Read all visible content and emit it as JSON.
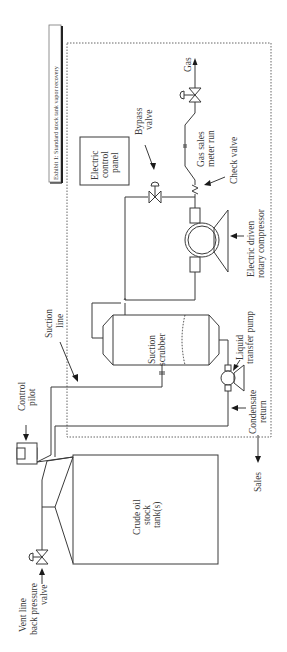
{
  "title": "Exhibit 1: Standard stock tank vapor recovery",
  "labels": {
    "gas": "Gas",
    "gas_sales_meter_run": [
      "Gas sales",
      "meter run"
    ],
    "check_valve": "Check valve",
    "bypass_valve": [
      "Bypass",
      "valve"
    ],
    "electric_control_panel": [
      "Electric",
      "control",
      "panel"
    ],
    "compressor": [
      "Electric driven",
      "rotary compressor"
    ],
    "suction_scrubber": [
      "Suction",
      "scrubber"
    ],
    "liquid_transfer_pump": [
      "Liquid",
      "transfer pump"
    ],
    "suction_line": [
      "Suction",
      "line"
    ],
    "condensate_return": [
      "Condensate",
      "return"
    ],
    "control_pilot": [
      "Control",
      "pilot"
    ],
    "sales": "Sales",
    "crude_oil_tank": [
      "Crude oil",
      "stock",
      "tank(s)"
    ],
    "vent_line_valve": [
      "Vent line",
      "back pressure",
      "valve"
    ]
  }
}
